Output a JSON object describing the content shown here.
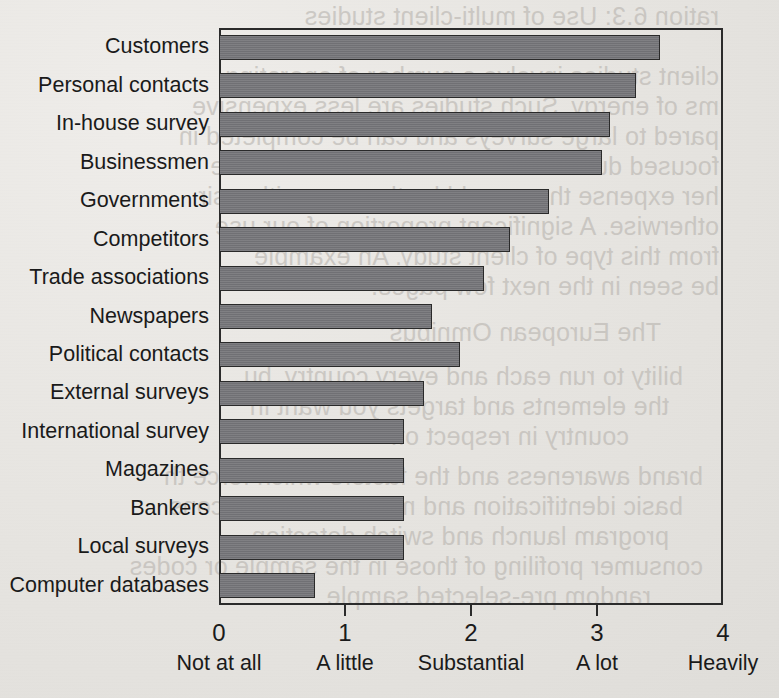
{
  "chart_data": {
    "type": "bar",
    "orientation": "horizontal",
    "title": "",
    "xlabel": "",
    "ylabel": "",
    "xlim": [
      0,
      4
    ],
    "grid": false,
    "legend": null,
    "categories": [
      "Customers",
      "Personal contacts",
      "In-house survey",
      "Businessmen",
      "Governments",
      "Competitors",
      "Trade associations",
      "Newspapers",
      "Political contacts",
      "External surveys",
      "International survey",
      "Magazines",
      "Bankers",
      "Local surveys",
      "Computer databases"
    ],
    "values": [
      3.5,
      3.31,
      3.1,
      3.04,
      2.62,
      2.31,
      2.1,
      1.69,
      1.91,
      1.63,
      1.47,
      1.47,
      1.47,
      1.47,
      0.76
    ],
    "x_ticks": [
      0,
      1,
      2,
      3,
      4
    ],
    "x_tick_labels": [
      "0",
      "1",
      "2",
      "3",
      "4"
    ],
    "x_tick_words": [
      "Not at all",
      "A little",
      "Substantial",
      "A lot",
      "Heavily"
    ],
    "bar_color": "#76767a",
    "bar_edge_color": "#2a2a2a",
    "frame_color": "#2b2b2b"
  },
  "showthrough": {
    "lines": [
      {
        "text": "ration 6.3:  Use of multi-client studies",
        "x": 60,
        "y": 2
      },
      {
        "text": "client studies involve a number of operating",
        "x": 60,
        "y": 62
      },
      {
        "text": "ms of energy. Such studies are less expensive",
        "x": 60,
        "y": 92
      },
      {
        "text": "pared to large surveys and can be completed in",
        "x": 60,
        "y": 122
      },
      {
        "text": "focused due to the nature of the work. These",
        "x": 60,
        "y": 152
      },
      {
        "text": "her expense than would be the case with a sir",
        "x": 60,
        "y": 182
      },
      {
        "text": "otherwise. A significant proportion of our use",
        "x": 60,
        "y": 212
      },
      {
        "text": "from this type of client study. An example",
        "x": 60,
        "y": 242
      },
      {
        "text": "be seen in the next few pages.",
        "x": 60,
        "y": 272
      },
      {
        "text": "The European Omnibus",
        "x": 118,
        "y": 318
      },
      {
        "text": "bility to run each and every country, bu",
        "x": 96,
        "y": 362
      },
      {
        "text": "the elements and targets you want in",
        "x": 110,
        "y": 392
      },
      {
        "text": "country in respect of:",
        "x": 150,
        "y": 422
      },
      {
        "text": "brand awareness and the factors which force th",
        "x": 76,
        "y": 462
      },
      {
        "text": "basic identification and measurement of cons",
        "x": 96,
        "y": 492
      },
      {
        "text": "program launch and switch detection",
        "x": 110,
        "y": 522
      },
      {
        "text": "consumer profiling of those in the sample or codes",
        "x": 76,
        "y": 552
      },
      {
        "text": "random pre-selected sample",
        "x": 128,
        "y": 582
      }
    ]
  }
}
